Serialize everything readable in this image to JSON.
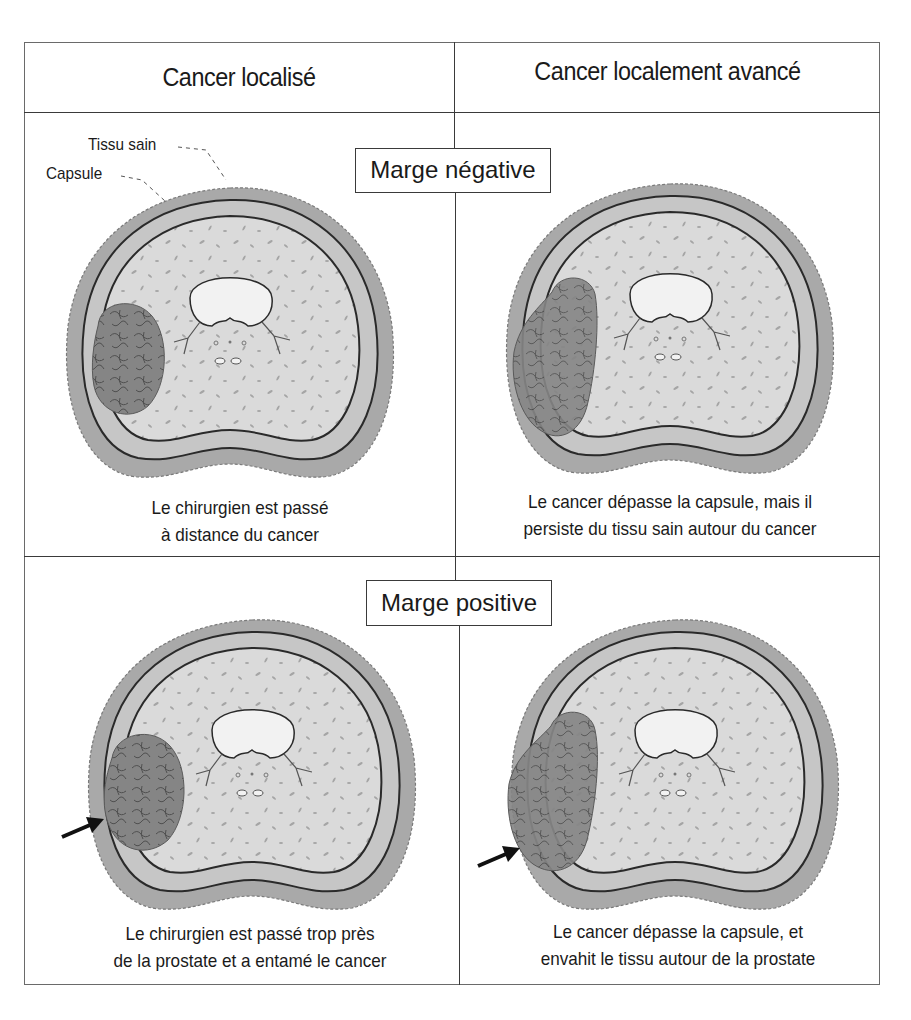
{
  "columns": [
    {
      "header": "Cancer localisé"
    },
    {
      "header": "Cancer localement avancé"
    }
  ],
  "rows": [
    {
      "margin_label": "Marge négative",
      "cells": [
        {
          "caption_line1": "Le chirurgien est passé",
          "caption_line2": "à distance du cancer",
          "cancer_extends_beyond_capsule": false,
          "arrow": false
        },
        {
          "caption_line1": "Le cancer dépasse la capsule, mais il",
          "caption_line2": "persiste du tissu sain autour du cancer",
          "cancer_extends_beyond_capsule": true,
          "arrow": false
        }
      ]
    },
    {
      "margin_label": "Marge positive",
      "cells": [
        {
          "caption_line1": "Le chirurgien est passé trop près",
          "caption_line2": "de la prostate et a entamé le cancer",
          "cancer_extends_beyond_capsule": false,
          "arrow": true
        },
        {
          "caption_line1": "Le cancer dépasse la capsule, et",
          "caption_line2": "envahit le tissu autour de la prostate",
          "cancer_extends_beyond_capsule": true,
          "arrow": true
        }
      ]
    }
  ],
  "annotations": {
    "healthy_tissue": "Tissu sain",
    "capsule": "Capsule"
  },
  "colors": {
    "outer_tissue": "#a9a9a9",
    "capsule_band": "#c6c6c6",
    "gland_interior": "#dadada",
    "urethra": "#f2f2f2",
    "cancer": "#858585",
    "outline": "#2a2a2a"
  }
}
